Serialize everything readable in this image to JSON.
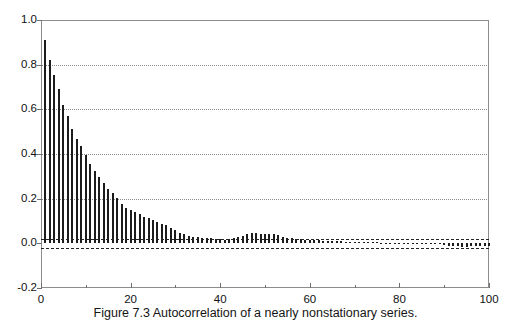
{
  "caption": "Figure 7.3  Autocorrelation of a nearly nonstationary series.",
  "axes": {
    "y_tick_labels": [
      "1.0",
      "0.8",
      "0.6",
      "0.4",
      "0.2",
      "0.0",
      "-0.2"
    ],
    "x_tick_labels": [
      "0",
      "20",
      "40",
      "60",
      "80",
      "100"
    ]
  },
  "chart_data": {
    "type": "bar",
    "title": "",
    "subtitle": "",
    "xlabel": "",
    "ylabel": "",
    "xlim": [
      0,
      100
    ],
    "ylim": [
      -0.2,
      1.0
    ],
    "grid": true,
    "gridlines_y": [
      0.2,
      0.4,
      0.6,
      0.8
    ],
    "y_ticks": [
      1.0,
      0.8,
      0.6,
      0.4,
      0.2,
      0.0,
      -0.2
    ],
    "x_ticks": [
      0,
      20,
      40,
      60,
      80,
      100
    ],
    "x_minor_ticks": [
      10,
      30,
      50,
      70,
      90
    ],
    "legend": null,
    "legend_position": "none",
    "confidence_bands": [
      0.02,
      -0.02
    ],
    "series_name": "Autocorrelation",
    "x": [
      1,
      2,
      3,
      4,
      5,
      6,
      7,
      8,
      9,
      10,
      11,
      12,
      13,
      14,
      15,
      16,
      17,
      18,
      19,
      20,
      21,
      22,
      23,
      24,
      25,
      26,
      27,
      28,
      29,
      30,
      31,
      32,
      33,
      34,
      35,
      36,
      37,
      38,
      39,
      40,
      41,
      42,
      43,
      44,
      45,
      46,
      47,
      48,
      49,
      50,
      51,
      52,
      53,
      54,
      55,
      56,
      57,
      58,
      59,
      60,
      61,
      62,
      63,
      64,
      65,
      66,
      67,
      68,
      69,
      70,
      71,
      72,
      73,
      74,
      75,
      76,
      77,
      78,
      79,
      80,
      81,
      82,
      83,
      84,
      85,
      86,
      87,
      88,
      89,
      90,
      91,
      92,
      93,
      94,
      95,
      96,
      97,
      98,
      99,
      100
    ],
    "values": [
      0.91,
      0.82,
      0.755,
      0.69,
      0.62,
      0.57,
      0.51,
      0.465,
      0.435,
      0.395,
      0.355,
      0.325,
      0.295,
      0.27,
      0.245,
      0.225,
      0.205,
      0.175,
      0.16,
      0.15,
      0.14,
      0.13,
      0.12,
      0.115,
      0.105,
      0.095,
      0.085,
      0.08,
      0.07,
      0.06,
      0.045,
      0.04,
      0.035,
      0.03,
      0.028,
      0.026,
      0.025,
      0.022,
      0.02,
      0.018,
      0.016,
      0.02,
      0.022,
      0.028,
      0.035,
      0.04,
      0.045,
      0.045,
      0.043,
      0.044,
      0.042,
      0.04,
      0.038,
      0.03,
      0.026,
      0.024,
      0.02,
      0.018,
      0.016,
      0.015,
      0.014,
      0.013,
      0.012,
      0.011,
      0.012,
      0.01,
      0.009,
      0.008,
      0.008,
      0.007,
      0.006,
      0.005,
      0.005,
      0.004,
      0.004,
      0.003,
      0.003,
      0.002,
      0.002,
      0.002,
      0.001,
      0.001,
      0.001,
      0.0,
      0.0,
      -0.001,
      -0.002,
      -0.003,
      -0.005,
      -0.008,
      -0.011,
      -0.013,
      -0.014,
      -0.015,
      -0.015,
      -0.014,
      -0.013,
      -0.012,
      -0.012,
      -0.013
    ]
  }
}
